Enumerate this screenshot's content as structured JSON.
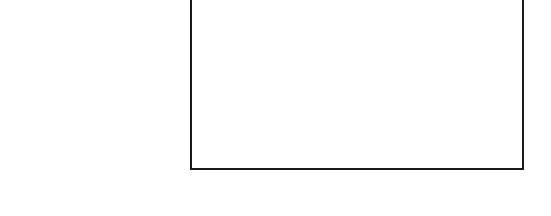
{
  "panel": {
    "content": "",
    "border_color": "#1a1a1a",
    "background_color": "#ffffff"
  }
}
